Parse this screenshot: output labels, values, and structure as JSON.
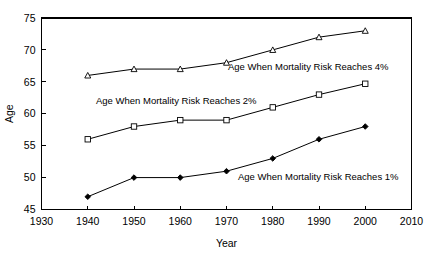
{
  "chart_data": {
    "type": "line",
    "title": "",
    "xlabel": "Year",
    "ylabel": "Age",
    "xlim": [
      1930,
      2010
    ],
    "ylim": [
      45,
      75
    ],
    "xticks": [
      1930,
      1940,
      1950,
      1960,
      1970,
      1980,
      1990,
      2000,
      2010
    ],
    "yticks": [
      45,
      50,
      55,
      60,
      65,
      70,
      75
    ],
    "xtick_labels": [
      "1930",
      "1940",
      "1950",
      "1960",
      "1970",
      "1980",
      "1990",
      "2000",
      "2010"
    ],
    "ytick_labels": [
      "45",
      "50",
      "55",
      "60",
      "65",
      "70",
      "75"
    ],
    "grid": false,
    "legend": "inline-annotations",
    "x": [
      1940,
      1950,
      1960,
      1970,
      1980,
      1990,
      2000
    ],
    "series": [
      {
        "name": "Age When Mortality Risk Reaches 4%",
        "marker": "triangle-open",
        "values": [
          66,
          67,
          67,
          68,
          70,
          72,
          73
        ],
        "annotation": {
          "text": "Age When Mortality Risk Reaches 4%",
          "x": 228,
          "y": 70
        }
      },
      {
        "name": "Age When Mortality Risk Reaches 2%",
        "marker": "square-open",
        "values": [
          56,
          58,
          59,
          59,
          61,
          63,
          64.7
        ],
        "annotation": {
          "text": "Age When Mortality Risk Reaches 2%",
          "x": 96,
          "y": 104
        }
      },
      {
        "name": "Age When Mortality Risk Reaches 1%",
        "marker": "diamond-filled",
        "values": [
          47,
          50,
          50,
          51,
          53,
          56,
          58
        ],
        "annotation": {
          "text": "Age When Mortality Risk Reaches 1%",
          "x": 238,
          "y": 180
        }
      }
    ],
    "colors": {
      "axis": "#000000",
      "line": "#000000",
      "background": "#ffffff",
      "marker_fill_open": "#ffffff",
      "marker_fill_closed": "#000000"
    }
  }
}
